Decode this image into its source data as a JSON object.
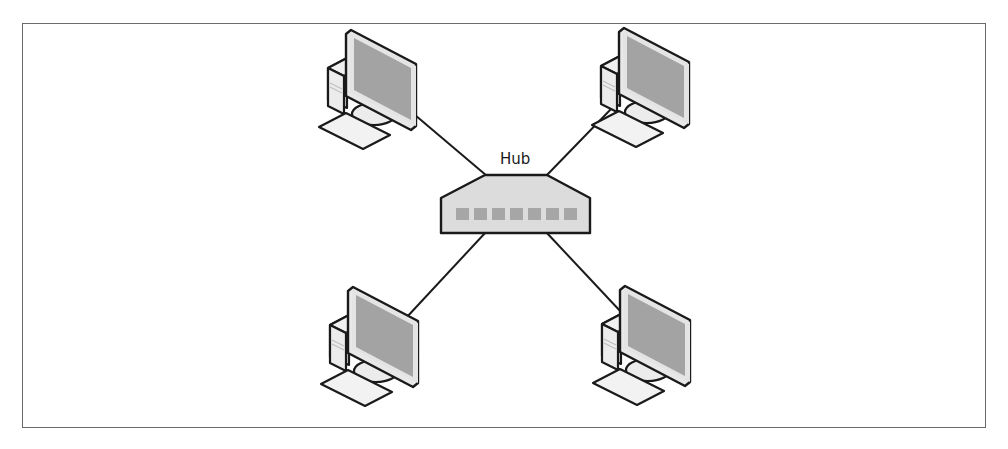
{
  "diagram": {
    "type": "star-network-topology",
    "hub": {
      "label": "Hub",
      "ports": 7,
      "colors": {
        "body": "#dcdcdc",
        "port": "#a6a6a6",
        "outline": "#1a1a1a"
      }
    },
    "nodes": [
      {
        "id": "computer-top-left",
        "kind": "desktop-computer"
      },
      {
        "id": "computer-top-right",
        "kind": "desktop-computer"
      },
      {
        "id": "computer-bottom-left",
        "kind": "desktop-computer"
      },
      {
        "id": "computer-bottom-right",
        "kind": "desktop-computer"
      }
    ],
    "links": [
      {
        "from": "computer-top-left",
        "to": "hub"
      },
      {
        "from": "computer-top-right",
        "to": "hub"
      },
      {
        "from": "computer-bottom-left",
        "to": "hub"
      },
      {
        "from": "computer-bottom-right",
        "to": "hub"
      }
    ],
    "colors": {
      "screen": "#a3a3a3",
      "monitor_bezel": "#e8e8e8",
      "case": "#ececec",
      "keyboard": "#f2f2f2",
      "outline": "#1a1a1a",
      "frame_border": "#6a6a6a"
    }
  }
}
